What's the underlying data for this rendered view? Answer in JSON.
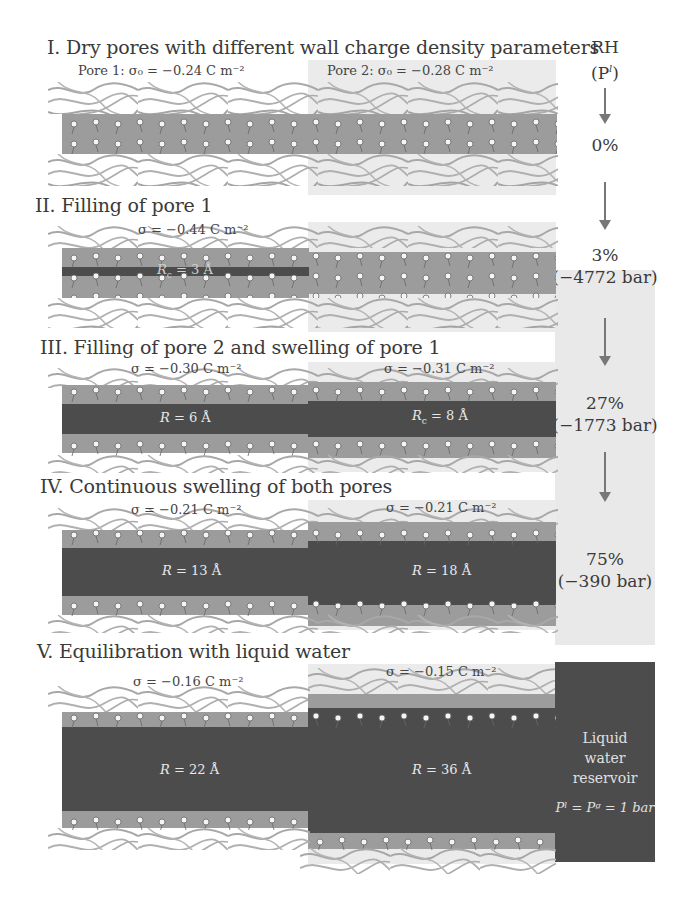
{
  "rh_column": {
    "header_line1": "RH",
    "header_line2": "(P",
    "header_sup": "l",
    "header_close": ")",
    "steps": [
      {
        "rh": "0%",
        "pressure": ""
      },
      {
        "rh": "3%",
        "pressure": "(−4772 bar)"
      },
      {
        "rh": "27%",
        "pressure": "(−1773 bar)"
      },
      {
        "rh": "75%",
        "pressure": "(−390 bar)"
      }
    ]
  },
  "panels": [
    {
      "title": "I. Dry pores with different wall charge density parameters",
      "pore1_label": "Pore 1: σ₀ = −0.24 C m⁻²",
      "pore2_label": "Pore 2: σ₀ = −0.28 C m⁻²"
    },
    {
      "title": "II. Filling of pore 1",
      "pore1_sigma": "σ = −0.44 C m⁻²",
      "pore1_radius_var": "R",
      "pore1_radius_sub": "c",
      "pore1_radius_val": " = 3 Å"
    },
    {
      "title": "III. Filling of pore 2 and swelling of pore 1",
      "pore1_sigma": "σ = −0.30 C m⁻²",
      "pore2_sigma": "σ = −0.31 C m⁻²",
      "pore1_radius_var": "R",
      "pore1_radius_val": " = 6 Å",
      "pore2_radius_var": "R",
      "pore2_radius_sub": "c",
      "pore2_radius_val": " = 8 Å"
    },
    {
      "title": "IV. Continuous swelling of both pores",
      "pore1_sigma": "σ = −0.21 C m⁻²",
      "pore2_sigma": "σ = −0.21 C m⁻²",
      "pore1_radius_var": "R",
      "pore1_radius_val": " = 13 Å",
      "pore2_radius_var": "R",
      "pore2_radius_val": " = 18 Å"
    },
    {
      "title": "V. Equilibration with liquid water",
      "pore1_sigma": "σ = −0.16 C m⁻²",
      "pore2_sigma": "σ = −0.15 C m⁻²",
      "pore1_radius_var": "R",
      "pore1_radius_val": " = 22 Å",
      "pore2_radius_var": "R",
      "pore2_radius_val": " = 36 Å",
      "reservoir_line1": "Liquid",
      "reservoir_line2": "water",
      "reservoir_line3": "reservoir",
      "reservoir_eq": "Pˡ = Pᵍ = 1 bar"
    }
  ],
  "colors": {
    "fiber": "#a8a8a8",
    "wall_band": "#9c9c9c",
    "water": "#4c4c4c",
    "pore2_background": "#ebebeb",
    "rh_column": "#e9e9e9",
    "arrow": "#777777"
  }
}
